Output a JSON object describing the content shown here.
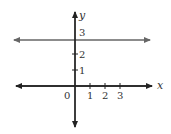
{
  "diagram": {
    "title": "",
    "axes": {
      "x_label": "x",
      "y_label": "y",
      "origin_label": "0",
      "x_ticks": [
        "1",
        "2",
        "3"
      ],
      "y_ticks": [
        "1",
        "2",
        "3"
      ]
    },
    "line": {
      "equation": "y = 3",
      "type": "horizontal",
      "y_value": 3
    },
    "colors": {
      "axis": "#222222",
      "line": "#666666"
    }
  }
}
